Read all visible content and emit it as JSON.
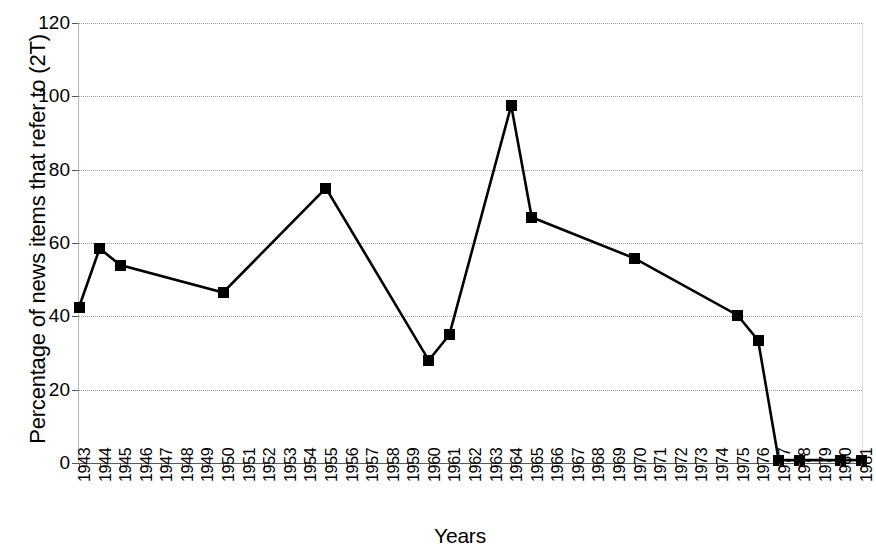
{
  "chart_data": {
    "type": "line",
    "title": "",
    "xlabel": "Years",
    "ylabel": "Percentage of news items that refer to (2T)",
    "xlim": [
      1943,
      1981
    ],
    "ylim": [
      0,
      120
    ],
    "yticks": [
      0,
      20,
      40,
      60,
      80,
      100,
      120
    ],
    "grid": true,
    "legend": "none",
    "marker": "filled-square",
    "line_color": "#000000",
    "marker_color": "#000000",
    "grid_color": "#9a9a9a",
    "categories": [
      "1943",
      "1944",
      "1945",
      "1946",
      "1947",
      "1948",
      "1949",
      "1950",
      "1951",
      "1952",
      "1953",
      "1954",
      "1955",
      "1956",
      "1957",
      "1958",
      "1959",
      "1960",
      "1961",
      "1962",
      "1963",
      "1964",
      "1965",
      "1966",
      "1967",
      "1968",
      "1969",
      "1970",
      "1971",
      "1972",
      "1973",
      "1974",
      "1975",
      "1976",
      "1977",
      "1978",
      "1979",
      "1980",
      "1981"
    ],
    "series": [
      {
        "name": "Percentage of news items that refer to (2T)",
        "points": [
          {
            "x": "1943",
            "y": 42.5
          },
          {
            "x": "1944",
            "y": 58.5
          },
          {
            "x": "1945",
            "y": 54.0
          },
          {
            "x": "1950",
            "y": 46.5
          },
          {
            "x": "1955",
            "y": 75.0
          },
          {
            "x": "1960",
            "y": 28.0
          },
          {
            "x": "1961",
            "y": 35.0
          },
          {
            "x": "1964",
            "y": 97.5
          },
          {
            "x": "1965",
            "y": 67.0
          },
          {
            "x": "1970",
            "y": 55.8
          },
          {
            "x": "1975",
            "y": 40.3
          },
          {
            "x": "1976",
            "y": 33.5
          },
          {
            "x": "1977",
            "y": 0.8
          },
          {
            "x": "1978",
            "y": 0.8
          },
          {
            "x": "1980",
            "y": 0.8
          },
          {
            "x": "1981",
            "y": 0.8
          }
        ]
      }
    ]
  }
}
